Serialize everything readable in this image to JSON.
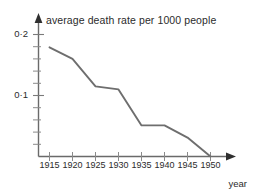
{
  "chart_data": {
    "type": "line",
    "title": "average death rate per 1000 people",
    "xlabel": "year",
    "ylabel": "",
    "x": [
      1915,
      1920,
      1925,
      1930,
      1935,
      1940,
      1945,
      1950
    ],
    "values": [
      0.179,
      0.16,
      0.115,
      0.11,
      0.051,
      0.051,
      0.031,
      0.0
    ],
    "categories": [
      "1915",
      "1920",
      "1925",
      "1930",
      "1935",
      "1940",
      "1945",
      "1950"
    ],
    "xtick_labels": [
      "1915",
      "1920",
      "1925",
      "1930",
      "1935",
      "1940",
      "1945",
      "1950"
    ],
    "ytick_labels": [
      "0·2",
      "0·1"
    ],
    "ytick_values": [
      0.2,
      0.1
    ],
    "yminor_step": 0.02,
    "xlim": [
      1915,
      1950
    ],
    "ylim": [
      0,
      0.22
    ],
    "grid": false,
    "legend": null,
    "line_color": "#6e6e6e",
    "axis_color": "#555555",
    "series": [
      {
        "name": "average death rate per 1000 people",
        "values": [
          0.179,
          0.16,
          0.115,
          0.11,
          0.051,
          0.051,
          0.031,
          0.0
        ]
      }
    ]
  },
  "axes": {
    "y_labels": [
      {
        "text": "0·2",
        "value": 0.2
      },
      {
        "text": "0·1",
        "value": 0.1
      }
    ],
    "x_labels": [
      {
        "text": "1915"
      },
      {
        "text": "1920"
      },
      {
        "text": "1925"
      },
      {
        "text": "1930"
      },
      {
        "text": "1935"
      },
      {
        "text": "1940"
      },
      {
        "text": "1945"
      },
      {
        "text": "1950"
      }
    ]
  }
}
